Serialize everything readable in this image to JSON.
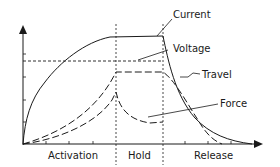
{
  "diagram": {
    "labels": {
      "current": "Current",
      "voltage": "Voltage",
      "travel": "Travel",
      "force": "Force"
    },
    "phases": {
      "activation": "Activation",
      "hold": "Hold",
      "release": "Release"
    },
    "colors": {
      "ink": "#1a1a1a",
      "background": "#ffffff"
    }
  }
}
